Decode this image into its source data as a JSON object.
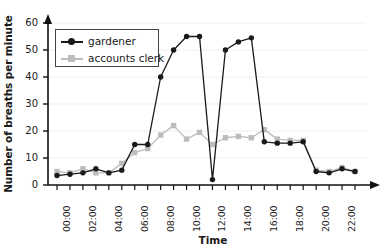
{
  "chart_data": {
    "type": "line",
    "title": "",
    "xlabel": "Time",
    "ylabel": "Number of breaths per minute",
    "ylim": [
      0,
      60
    ],
    "yticks": [
      0,
      10,
      20,
      30,
      40,
      50,
      60
    ],
    "xlim": [
      0,
      23
    ],
    "x": [
      0,
      1,
      2,
      3,
      4,
      5,
      6,
      7,
      8,
      9,
      10,
      11,
      12,
      13,
      14,
      15,
      16,
      17,
      18,
      19,
      20,
      21,
      22,
      23
    ],
    "categories": [
      "00:00",
      "01:00",
      "02:00",
      "03:00",
      "04:00",
      "05:00",
      "06:00",
      "07:00",
      "08:00",
      "09:00",
      "10:00",
      "11:00",
      "12:00",
      "13:00",
      "14:00",
      "15:00",
      "16:00",
      "17:00",
      "18:00",
      "19:00",
      "20:00",
      "21:00",
      "22:00",
      "23:00"
    ],
    "xticklabels": [
      "00:00",
      "02:00",
      "04:00",
      "06:00",
      "08:00",
      "10:00",
      "12:00",
      "14:00",
      "16:00",
      "18:00",
      "20:00",
      "22:00"
    ],
    "xticklabel_indices": [
      0,
      2,
      4,
      6,
      8,
      10,
      12,
      14,
      16,
      18,
      20,
      22
    ],
    "grid": "horizontal",
    "legend_position": "upper left",
    "series": [
      {
        "name": "gardener",
        "color": "#1a1a1a",
        "marker": "circle",
        "values": [
          3.5,
          4,
          4.5,
          6,
          4.5,
          5.5,
          15,
          15,
          40,
          50,
          55,
          55,
          2,
          50,
          53,
          54.5,
          16,
          15.5,
          15.5,
          16,
          5,
          4.5,
          6,
          5
        ]
      },
      {
        "name": "accounts clerk",
        "color": "#bdbdbd",
        "marker": "square",
        "values": [
          5,
          4.5,
          6,
          4.5,
          4.5,
          8,
          12,
          13.5,
          18.5,
          22,
          17,
          19.5,
          15,
          17.5,
          18,
          17.5,
          20.5,
          17,
          16.5,
          16.5,
          5.5,
          5,
          6.5,
          5
        ]
      }
    ]
  },
  "legend": {
    "items": [
      {
        "label": "gardener"
      },
      {
        "label": "accounts clerk"
      }
    ]
  },
  "axes": {
    "x_title": "Time",
    "y_title": "Number of breaths per minute"
  }
}
